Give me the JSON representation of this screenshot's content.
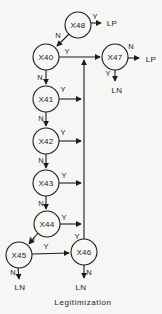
{
  "figure": {
    "caption": "Legitimization",
    "nodes": [
      {
        "id": "x48",
        "label": "X48"
      },
      {
        "id": "x40",
        "label": "X40"
      },
      {
        "id": "x47",
        "label": "X47"
      },
      {
        "id": "x41",
        "label": "X41"
      },
      {
        "id": "x42",
        "label": "X42"
      },
      {
        "id": "x43",
        "label": "X43"
      },
      {
        "id": "x44",
        "label": "X44"
      },
      {
        "id": "x45",
        "label": "X45"
      },
      {
        "id": "x46",
        "label": "X46"
      }
    ],
    "terminals": [
      {
        "id": "lp-top",
        "label": "LP"
      },
      {
        "id": "lp-right",
        "label": "LP"
      },
      {
        "id": "ln-x47",
        "label": "LN"
      },
      {
        "id": "ln-x45",
        "label": "LN"
      },
      {
        "id": "ln-x46",
        "label": "LN"
      }
    ],
    "edge_labels": [
      {
        "from": "X48",
        "to": "LP",
        "label": "Y"
      },
      {
        "from": "X48",
        "to": "X40",
        "label": "N"
      },
      {
        "from": "X40",
        "to": "X47",
        "label": "Y"
      },
      {
        "from": "X40",
        "to": "X41",
        "label": "N"
      },
      {
        "from": "X47",
        "to": "LP",
        "label": "N"
      },
      {
        "from": "X47",
        "to": "LN",
        "label": "Y"
      },
      {
        "from": "X41",
        "to": "collector",
        "label": "Y"
      },
      {
        "from": "X41",
        "to": "X42",
        "label": "N"
      },
      {
        "from": "X42",
        "to": "collector",
        "label": "Y"
      },
      {
        "from": "X42",
        "to": "X43",
        "label": "N"
      },
      {
        "from": "X43",
        "to": "collector",
        "label": "Y"
      },
      {
        "from": "X43",
        "to": "X44",
        "label": "N"
      },
      {
        "from": "X44",
        "to": "collector",
        "label": "Y"
      },
      {
        "from": "X44",
        "to": "X45",
        "label": "N"
      },
      {
        "from": "X45",
        "to": "X46",
        "label": "Y"
      },
      {
        "from": "X45",
        "to": "LN",
        "label": "N"
      },
      {
        "from": "X46",
        "to": "collector",
        "label": "Y"
      },
      {
        "from": "X46",
        "to": "LN",
        "label": "N"
      }
    ],
    "ink_color": "#1c1c1c",
    "paper_color": "#f6f6f4"
  }
}
